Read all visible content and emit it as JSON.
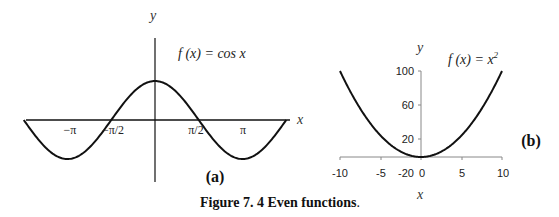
{
  "caption": "Figure 7. 4 Even functions",
  "caption_period": ".",
  "chart_data": [
    {
      "type": "line",
      "panel_label": "(a)",
      "title": "f (x) = cos x",
      "xlabel": "x",
      "ylabel": "y",
      "x_tick_labels": [
        "−π",
        "−π/2",
        "π/2",
        "π"
      ],
      "x_tick_values": [
        -3.1416,
        -1.5708,
        1.5708,
        3.1416
      ],
      "xlim": [
        -4.712,
        4.712
      ],
      "ylim": [
        -1,
        1
      ],
      "grid": false,
      "series": [
        {
          "name": "cos x",
          "x": [
            -4.712,
            -3.927,
            -3.1416,
            -2.356,
            -1.5708,
            -0.785,
            0,
            0.785,
            1.5708,
            2.356,
            3.1416,
            3.927,
            4.712
          ],
          "y": [
            0,
            -0.707,
            -1,
            -0.707,
            0,
            0.707,
            1,
            0.707,
            0,
            -0.707,
            -1,
            -0.707,
            0
          ]
        }
      ]
    },
    {
      "type": "line",
      "panel_label": "(b)",
      "title": "f (x) = x²",
      "title_base": "f (x) = x",
      "title_sup": "2",
      "xlabel": "x",
      "ylabel": "y",
      "x_tick_labels": [
        "-10",
        "-5",
        "0",
        "5",
        "10"
      ],
      "x_tick_values": [
        -10,
        -5,
        0,
        5,
        10
      ],
      "y_tick_labels": [
        "-20",
        "20",
        "60",
        "100"
      ],
      "y_tick_values": [
        -20,
        20,
        60,
        100
      ],
      "xlim": [
        -10,
        10
      ],
      "ylim": [
        0,
        100
      ],
      "grid": false,
      "series": [
        {
          "name": "x^2",
          "x": [
            -10,
            -8,
            -6,
            -4,
            -2,
            0,
            2,
            4,
            6,
            8,
            10
          ],
          "y": [
            100,
            64,
            36,
            16,
            4,
            0,
            4,
            16,
            36,
            64,
            100
          ]
        }
      ]
    }
  ]
}
